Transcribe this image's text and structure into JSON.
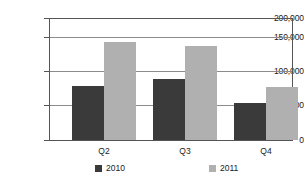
{
  "chart_data": {
    "type": "bar",
    "title": "",
    "subtitle": "",
    "xlabel": "",
    "ylabel": "",
    "categories": [
      "Q2",
      "Q3",
      "Q4"
    ],
    "series": [
      {
        "name": "2010",
        "color": "#3a3a3a",
        "values": [
          88000,
          100000,
          60000
        ]
      },
      {
        "name": "2011",
        "color": "#b0b0b0",
        "values": [
          160000,
          155000,
          87000
        ]
      }
    ],
    "ylim": [
      0,
      200000
    ],
    "yticks": [
      0,
      50000,
      100000,
      150000,
      200000
    ],
    "ytick_labels": [
      "0",
      "50,000",
      "100,000",
      "150,000",
      "200,000"
    ],
    "grid": true,
    "grid_axis": "y",
    "legend_position": "bottom"
  },
  "axes": {
    "y": {
      "ticks": [
        {
          "label": "200,000",
          "value": 200000
        },
        {
          "label": "150,000",
          "value": 150000
        },
        {
          "label": "100,000",
          "value": 100000
        },
        {
          "label": "50,000",
          "value": 50000
        },
        {
          "label": "0",
          "value": 0
        }
      ]
    },
    "x": {
      "ticks": [
        {
          "label": "Q2"
        },
        {
          "label": "Q3"
        },
        {
          "label": "Q4"
        }
      ]
    }
  },
  "legend": {
    "items": [
      {
        "label": "2010",
        "color": "#3a3a3a"
      },
      {
        "label": "2011",
        "color": "#b0b0b0"
      }
    ]
  },
  "colors": {
    "series_2010": "#3a3a3a",
    "series_2011": "#b0b0b0",
    "axis": "#555555",
    "grid": "#8c8c8c",
    "text": "#1a1a1a",
    "background": "#ffffff"
  }
}
